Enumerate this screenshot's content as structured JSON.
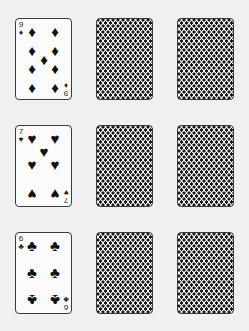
{
  "colors": {
    "background": "#f0f0f0",
    "card_face": "#fbfbfb",
    "card_border": "#3a3a3a",
    "ink": "#111111"
  },
  "grid": {
    "rows": [
      {
        "face_card": {
          "rank": "9",
          "suit": "diamonds",
          "suit_glyph": "♦"
        },
        "hidden_cards": 2
      },
      {
        "face_card": {
          "rank": "7",
          "suit": "hearts",
          "suit_glyph": "♥"
        },
        "hidden_cards": 2
      },
      {
        "face_card": {
          "rank": "6",
          "suit": "clubs",
          "suit_glyph": "♣"
        },
        "hidden_cards": 2
      }
    ]
  }
}
